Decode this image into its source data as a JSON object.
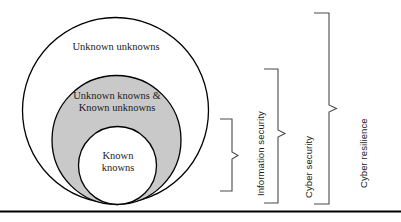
{
  "diagram": {
    "type": "nested-circles-with-brackets",
    "background_color": "#ffffff",
    "stroke_color": "#000000",
    "circles": [
      {
        "id": "unknown-unknowns",
        "label": "Unknown unknowns",
        "fill_color": "#ffffff",
        "level": 1
      },
      {
        "id": "unknown-knowns-and-known-unknowns",
        "label": "Unknown knowns &\nKnown unknowns",
        "fill_color": "#c9c9c9",
        "level": 2
      },
      {
        "id": "known-knowns",
        "label": "Known\nknowns",
        "fill_color": "#ffffff",
        "level": 3
      }
    ],
    "brackets": [
      {
        "id": "information-security",
        "label": "Information security",
        "scope": "known-knowns"
      },
      {
        "id": "cyber-security",
        "label": "Cyber security",
        "scope": "unknown-knowns-and-known-unknowns"
      },
      {
        "id": "cyber-resilience",
        "label": "Cyber resilience",
        "scope": "unknown-unknowns"
      }
    ],
    "footer_rule": {
      "id": "bottom-rule",
      "color": "#000000"
    }
  }
}
